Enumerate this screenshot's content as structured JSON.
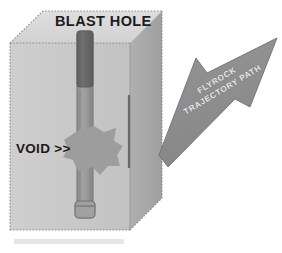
{
  "figure": {
    "type": "blast-hole-flyrock-diagram",
    "background_color": "#ffffff"
  },
  "labels": {
    "blast_hole": "BLAST HOLE",
    "void": "VOID >>",
    "flyrock_line1": "FLYROCK",
    "flyrock_line2": "TRAJECTORY PATH"
  },
  "colors": {
    "rock_front_face": "#c9c9c9",
    "rock_top_face": "#d8d8d8",
    "rock_side_face": "#a8a8a8",
    "hole_charge_dark": "#6b6b6b",
    "hole_column_light": "#9a9a9a",
    "hole_outline": "#7a7a7a",
    "void_burst": "#9d9d9d",
    "arrow_fill": "#8e8e8e",
    "arrow_outline": "#6f6f6f",
    "dotted_edge": "#8c8c8c",
    "label_text": "#1c1c1c",
    "arrow_text": "#e8e8e8",
    "bottom_shadow_band": "#e2e2e2"
  },
  "elements": {
    "rock_block_name": "rock mass block",
    "blast_hole_name": "vertical blast hole",
    "charge_name": "explosive charge column",
    "void_name": "geological void / cavity",
    "arrow_name": "flyrock trajectory arrow"
  }
}
